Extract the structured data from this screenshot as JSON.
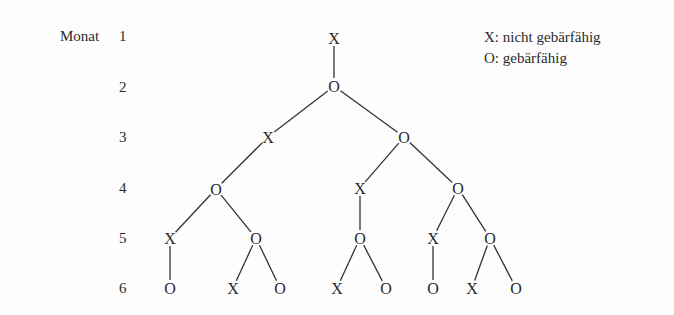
{
  "axis": {
    "title": "Monat",
    "months": [
      {
        "label": "1",
        "y": 36
      },
      {
        "label": "2",
        "y": 86
      },
      {
        "label": "3",
        "y": 137
      },
      {
        "label": "4",
        "y": 188
      },
      {
        "label": "5",
        "y": 238
      },
      {
        "label": "6",
        "y": 288
      }
    ]
  },
  "legend": {
    "x_item": "X: nicht gebärfähig",
    "o_item": "O: gebärfähig"
  },
  "tree": {
    "line_color": "#333333",
    "nodes": [
      {
        "id": "n1",
        "label": "X",
        "x": 334,
        "y": 38
      },
      {
        "id": "n2",
        "label": "O",
        "x": 334,
        "y": 86
      },
      {
        "id": "n3",
        "label": "X",
        "x": 268,
        "y": 137
      },
      {
        "id": "n4",
        "label": "O",
        "x": 404,
        "y": 137
      },
      {
        "id": "n5",
        "label": "O",
        "x": 216,
        "y": 189
      },
      {
        "id": "n6",
        "label": "X",
        "x": 360,
        "y": 188
      },
      {
        "id": "n7",
        "label": "O",
        "x": 458,
        "y": 188
      },
      {
        "id": "n8",
        "label": "X",
        "x": 170,
        "y": 238
      },
      {
        "id": "n9",
        "label": "O",
        "x": 256,
        "y": 238
      },
      {
        "id": "n10",
        "label": "O",
        "x": 360,
        "y": 238
      },
      {
        "id": "n11",
        "label": "X",
        "x": 433,
        "y": 238
      },
      {
        "id": "n12",
        "label": "O",
        "x": 490,
        "y": 238
      },
      {
        "id": "n13",
        "label": "O",
        "x": 170,
        "y": 288
      },
      {
        "id": "n14",
        "label": "X",
        "x": 233,
        "y": 288
      },
      {
        "id": "n15",
        "label": "O",
        "x": 280,
        "y": 288
      },
      {
        "id": "n16",
        "label": "X",
        "x": 337,
        "y": 288
      },
      {
        "id": "n17",
        "label": "O",
        "x": 386,
        "y": 288
      },
      {
        "id": "n18",
        "label": "O",
        "x": 433,
        "y": 288
      },
      {
        "id": "n19",
        "label": "X",
        "x": 472,
        "y": 288
      },
      {
        "id": "n20",
        "label": "O",
        "x": 516,
        "y": 288
      }
    ],
    "edges": [
      [
        "n1",
        "n2"
      ],
      [
        "n2",
        "n3"
      ],
      [
        "n2",
        "n4"
      ],
      [
        "n3",
        "n5"
      ],
      [
        "n4",
        "n6"
      ],
      [
        "n4",
        "n7"
      ],
      [
        "n5",
        "n8"
      ],
      [
        "n5",
        "n9"
      ],
      [
        "n6",
        "n10"
      ],
      [
        "n7",
        "n11"
      ],
      [
        "n7",
        "n12"
      ],
      [
        "n8",
        "n13"
      ],
      [
        "n9",
        "n14"
      ],
      [
        "n9",
        "n15"
      ],
      [
        "n10",
        "n16"
      ],
      [
        "n10",
        "n17"
      ],
      [
        "n11",
        "n18"
      ],
      [
        "n12",
        "n19"
      ],
      [
        "n12",
        "n20"
      ]
    ]
  }
}
